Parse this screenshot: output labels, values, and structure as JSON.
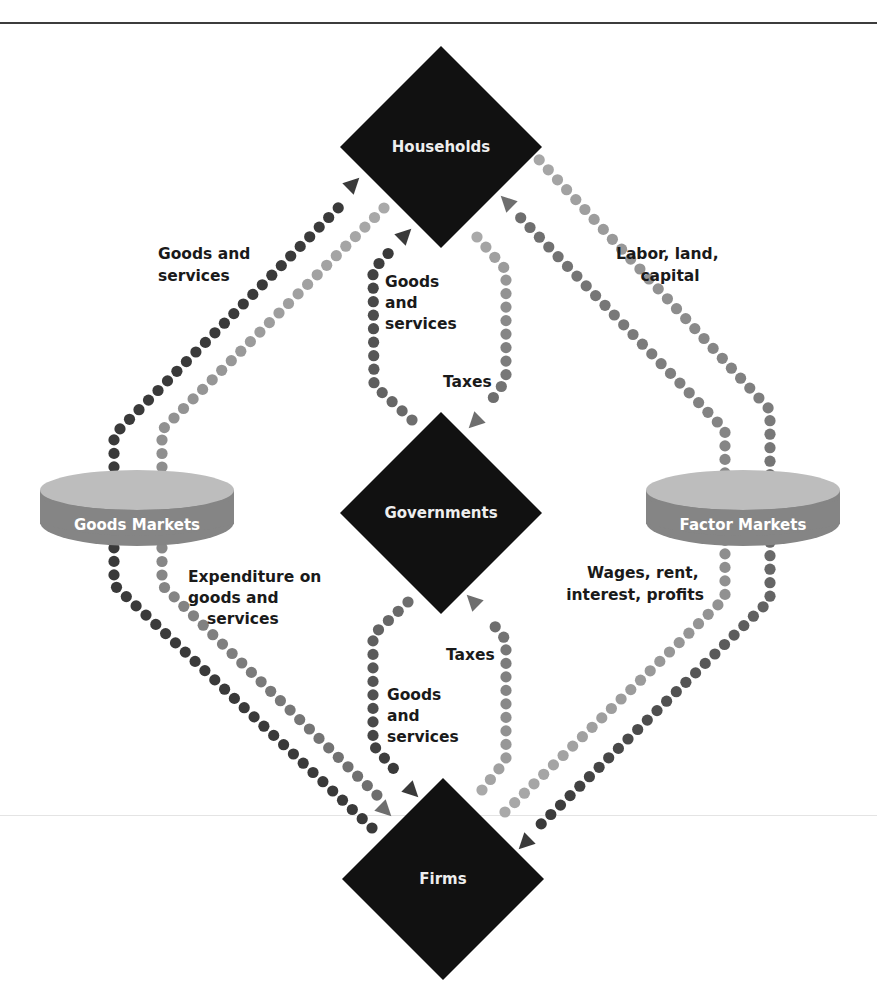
{
  "diagram": {
    "colors": {
      "node_fill": "#111111",
      "node_text": "#eeeeee",
      "dot_dark": "#3a3a3a",
      "dot_mid": "#6e6e6e",
      "dot_light": "#a9a9a9",
      "ring_top": "#bdbdbd",
      "ring_band": "#858585",
      "label_text": "#1a1a1a"
    },
    "nodes": {
      "households": {
        "label": "Households",
        "cx": 441,
        "cy": 147,
        "r": 101
      },
      "governments": {
        "label": "Governments",
        "cx": 441,
        "cy": 513,
        "r": 101
      },
      "firms": {
        "label": "Firms",
        "cx": 443,
        "cy": 880,
        "r": 101
      }
    },
    "markets": {
      "goods": {
        "label": "Goods Markets",
        "cx": 137,
        "cy": 505
      },
      "factor": {
        "label": "Factor Markets",
        "cx": 743,
        "cy": 505
      }
    },
    "flow_labels": {
      "goods_to_households": [
        "Goods and",
        "services"
      ],
      "labor_to_factor": [
        "Labor, land,",
        "capital"
      ],
      "gov_to_households_goods": [
        "Goods",
        "and",
        "services"
      ],
      "households_taxes": "Taxes",
      "expenditure": [
        "Expenditure on",
        "goods and",
        "services"
      ],
      "wages": [
        "Wages, rent,",
        "interest, profits"
      ],
      "firms_taxes": "Taxes",
      "gov_to_firms_goods": [
        "Goods",
        "and",
        "services"
      ]
    },
    "edges": [
      {
        "from": "Goods Markets",
        "to": "Households",
        "label": "Goods and services",
        "shade": "dark"
      },
      {
        "from": "Households",
        "to": "Goods Markets",
        "label": "Expenditure on goods and services",
        "shade": "light"
      },
      {
        "from": "Goods Markets",
        "to": "Firms",
        "label": "Expenditure on goods and services",
        "shade": "light"
      },
      {
        "from": "Firms",
        "to": "Goods Markets",
        "label": "Goods and services",
        "shade": "dark"
      },
      {
        "from": "Households",
        "to": "Factor Markets",
        "label": "Labor, land, capital",
        "shade": "dark"
      },
      {
        "from": "Factor Markets",
        "to": "Firms",
        "label": "Labor, land, capital",
        "shade": "dark"
      },
      {
        "from": "Firms",
        "to": "Factor Markets",
        "label": "Wages, rent, interest, profits",
        "shade": "light"
      },
      {
        "from": "Factor Markets",
        "to": "Households",
        "label": "Wages, rent, interest, profits",
        "shade": "mid"
      },
      {
        "from": "Governments",
        "to": "Households",
        "label": "Goods and services",
        "shade": "dark"
      },
      {
        "from": "Households",
        "to": "Governments",
        "label": "Taxes",
        "shade": "mid"
      },
      {
        "from": "Governments",
        "to": "Firms",
        "label": "Goods and services",
        "shade": "dark"
      },
      {
        "from": "Firms",
        "to": "Governments",
        "label": "Taxes",
        "shade": "mid"
      }
    ]
  }
}
